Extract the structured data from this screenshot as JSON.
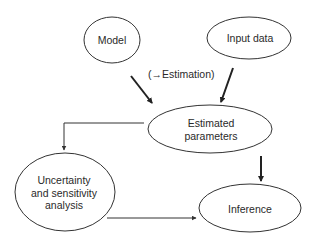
{
  "diagram": {
    "nodes": [
      {
        "id": "model",
        "label": "Model",
        "cx": 112,
        "cy": 40,
        "rx": 28,
        "ry": 23
      },
      {
        "id": "input-data",
        "label": "Input data",
        "cx": 249,
        "cy": 38,
        "rx": 42,
        "ry": 21
      },
      {
        "id": "estimated-parameters",
        "label": "Estimated\nparameters",
        "cx": 210,
        "cy": 129,
        "rx": 62,
        "ry": 24
      },
      {
        "id": "uncertainty",
        "label": "Uncertainty\nand sensitivity\nanalysis",
        "cx": 65,
        "cy": 192,
        "rx": 50,
        "ry": 39
      },
      {
        "id": "inference",
        "label": "Inference",
        "cx": 250,
        "cy": 208,
        "rx": 51,
        "ry": 24
      }
    ],
    "edges": [
      {
        "from": "model",
        "to": "estimated-parameters",
        "style": "thick"
      },
      {
        "from": "input-data",
        "to": "estimated-parameters",
        "style": "thick"
      },
      {
        "from": "estimated-parameters",
        "to": "uncertainty",
        "style": "thin-elbow"
      },
      {
        "from": "estimated-parameters",
        "to": "inference",
        "style": "thick"
      },
      {
        "from": "uncertainty",
        "to": "inference",
        "style": "thin"
      }
    ],
    "edge_label": "(→Estimation)",
    "labels": {
      "model": "Model",
      "input_data": "Input data",
      "estimated_line1": "Estimated",
      "estimated_line2": "parameters",
      "uncertainty_line1": "Uncertainty",
      "uncertainty_line2": "and sensitivity",
      "uncertainty_line3": "analysis",
      "inference": "Inference"
    },
    "colors": {
      "stroke": "#333333",
      "text": "#2a2a2a",
      "background": "#ffffff"
    }
  }
}
